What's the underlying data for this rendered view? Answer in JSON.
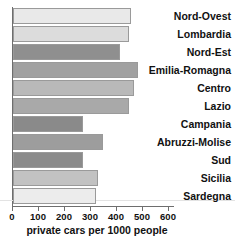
{
  "chart_data": {
    "type": "bar",
    "orientation": "horizontal",
    "title": "",
    "xlabel": "private cars per 1000 people",
    "ylabel": "",
    "xlim": [
      0,
      620
    ],
    "grid": false,
    "legend": null,
    "categories": [
      "Nord-Ovest",
      "Lombardia",
      "Nord-Est",
      "Emilia-Romagna",
      "Centro",
      "Lazio",
      "Campania",
      "Abruzzi-Molise",
      "Sud",
      "Sicilia",
      "Sardegna"
    ],
    "values": [
      455,
      445,
      410,
      480,
      465,
      445,
      270,
      345,
      270,
      325,
      320
    ],
    "bar_colors": [
      "#e9e9e9",
      "#dcdcdc",
      "#8f8f8f",
      "#a1a1a1",
      "#b9b9b9",
      "#a9a9a9",
      "#8a8a8a",
      "#9d9d9d",
      "#8b8b8b",
      "#c2c2c2",
      "#ececec"
    ],
    "xticks": [
      0,
      100,
      200,
      300,
      400,
      500,
      600
    ],
    "xtick_labels": [
      "0",
      "100",
      "200",
      "300",
      "400",
      "500",
      "600"
    ]
  },
  "axis": {
    "x_title": "private cars per 1000 people",
    "tick_labels": [
      "0",
      "100",
      "200",
      "300",
      "400",
      "500",
      "600"
    ]
  },
  "bars": [
    {
      "label": "Nord-Ovest",
      "value": 455,
      "color": "#e9e9e9"
    },
    {
      "label": "Lombardia",
      "value": 445,
      "color": "#dcdcdc"
    },
    {
      "label": "Nord-Est",
      "value": 410,
      "color": "#8f8f8f"
    },
    {
      "label": "Emilia-Romagna",
      "value": 480,
      "color": "#a1a1a1"
    },
    {
      "label": "Centro",
      "value": 465,
      "color": "#b9b9b9"
    },
    {
      "label": "Lazio",
      "value": 445,
      "color": "#a9a9a9"
    },
    {
      "label": "Campania",
      "value": 270,
      "color": "#8a8a8a"
    },
    {
      "label": "Abruzzi-Molise",
      "value": 345,
      "color": "#9d9d9d"
    },
    {
      "label": "Sud",
      "value": 270,
      "color": "#8b8b8b"
    },
    {
      "label": "Sicilia",
      "value": 325,
      "color": "#c2c2c2"
    },
    {
      "label": "Sardegna",
      "value": 320,
      "color": "#ececec"
    }
  ],
  "title_strip": {
    "text": ""
  }
}
